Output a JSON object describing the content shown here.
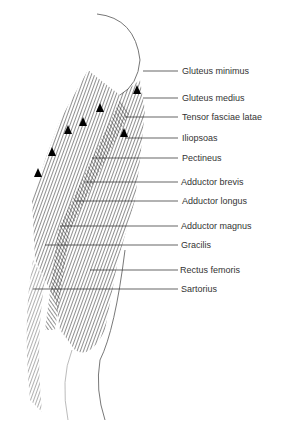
{
  "diagram": {
    "labels": [
      {
        "text": "Gluteus minimus",
        "y": 71,
        "line_from_x": 143
      },
      {
        "text": "Gluteus medius",
        "y": 98,
        "line_from_x": 143
      },
      {
        "text": "Tensor fasciae latae",
        "y": 117,
        "line_from_x": 125
      },
      {
        "text": "Iliopsoas",
        "y": 138,
        "line_from_x": 125
      },
      {
        "text": "Pectineus",
        "y": 158,
        "line_from_x": 92
      },
      {
        "text": "Adductor brevis",
        "y": 182,
        "line_from_x": 85
      },
      {
        "text": "Adductor longus",
        "y": 201,
        "line_from_x": 75
      },
      {
        "text": "Adductor magnus",
        "y": 226,
        "line_from_x": 60
      },
      {
        "text": "Gracilis",
        "y": 245,
        "line_from_x": 45
      },
      {
        "text": "Rectus femoris",
        "y": 270,
        "line_from_x": 90
      },
      {
        "text": "Sartorius",
        "y": 289,
        "line_from_x": 33
      }
    ],
    "colors": {
      "ink": "#1a1a1a",
      "label": "#333333",
      "background": "#ffffff"
    }
  }
}
